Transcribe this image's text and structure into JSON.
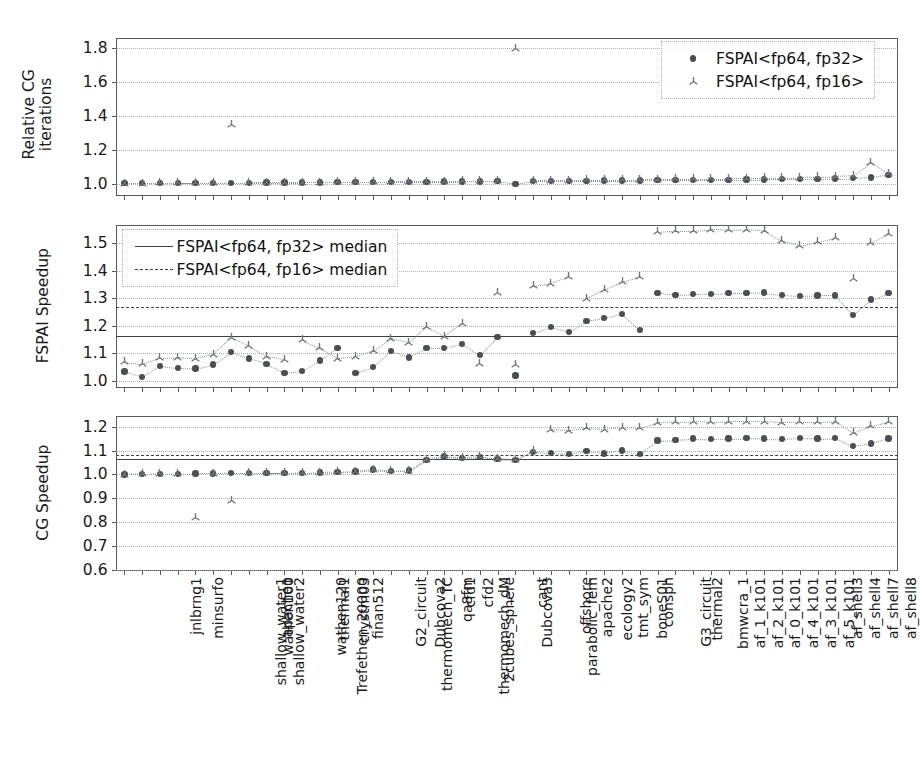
{
  "chart_data": {
    "type": "scatter",
    "title": "",
    "xlabel": "",
    "categories": [
      "jnlbrng1",
      "minsurfo",
      "shallow_water1",
      "shallow_water2",
      "wathen100",
      "apache1",
      "Trefethen_20000",
      "wathen120",
      "thermal1",
      "crystm03",
      "finan512",
      "thermomech_TC",
      "G2_circuit",
      "Dubcova2",
      "thermomech_dM",
      "2cubes_sphere",
      "qa8fm",
      "cfd1",
      "cfd2",
      "Dubcova3",
      "parabolic_fem",
      "cant",
      "offshore",
      "apache2",
      "ecology2",
      "tmt_sym",
      "boneS01",
      "consph",
      "G3_circuit",
      "thermal2",
      "bmwcra_1",
      "af_1_k101",
      "af_2_k101",
      "af_0_k101",
      "af_4_k101",
      "af_3_k101",
      "af_5_k101",
      "af_shell3",
      "af_shell4",
      "af_shell7",
      "af_shell8",
      "StocF-1465",
      "Emilia_923",
      "bone010"
    ],
    "legend_position": "upper right",
    "grid": true,
    "panels": [
      {
        "ylabel": "Relative CG\niterations",
        "ylim": [
          0.93,
          1.86
        ],
        "yticks": [
          1.0,
          1.2,
          1.4,
          1.6,
          1.8
        ],
        "ytick_labels": [
          "1.0",
          "1.2",
          "1.4",
          "1.6",
          "1.8"
        ],
        "legend": {
          "position": "upper-right",
          "entries": [
            {
              "label": "FSPAI<fp64, fp32>",
              "marker": "circle"
            },
            {
              "label": "FSPAI<fp64, fp16>",
              "marker": "tri-down"
            }
          ]
        },
        "series": [
          {
            "name": "FSPAI<fp64, fp32>",
            "marker": "circle",
            "values": [
              1.005,
              1.005,
              1.005,
              1.006,
              1.006,
              1.007,
              1.008,
              1.008,
              1.009,
              1.009,
              1.01,
              1.01,
              1.011,
              1.012,
              1.012,
              1.013,
              1.014,
              1.014,
              1.015,
              1.016,
              1.016,
              1.017,
              1.0,
              1.018,
              1.019,
              1.019,
              1.02,
              1.021,
              1.021,
              1.022,
              1.023,
              1.024,
              1.024,
              1.025,
              1.026,
              1.027,
              1.028,
              1.029,
              1.03,
              1.031,
              1.033,
              1.035,
              1.04,
              1.055
            ]
          },
          {
            "name": "FSPAI<fp64, fp16>",
            "marker": "tri-down",
            "values": [
              1.006,
              1.006,
              1.007,
              1.007,
              1.008,
              1.009,
              1.35,
              1.01,
              1.01,
              1.011,
              1.012,
              1.012,
              1.013,
              1.014,
              1.015,
              1.016,
              1.016,
              1.017,
              1.018,
              1.019,
              1.02,
              1.021,
              1.8,
              1.022,
              1.023,
              1.024,
              1.025,
              1.026,
              1.027,
              1.028,
              1.03,
              1.031,
              1.032,
              1.033,
              1.034,
              1.035,
              1.036,
              1.038,
              1.04,
              1.042,
              1.045,
              1.05,
              1.13,
              1.062
            ]
          }
        ]
      },
      {
        "ylabel": "FSPAI Speedup",
        "ylim": [
          0.975,
          1.565
        ],
        "yticks": [
          1.0,
          1.1,
          1.2,
          1.3,
          1.4,
          1.5
        ],
        "ytick_labels": [
          "1.0",
          "1.1",
          "1.2",
          "1.3",
          "1.4",
          "1.5"
        ],
        "legend": {
          "position": "upper-left",
          "entries": [
            {
              "label": "FSPAI<fp64, fp32> median",
              "marker": "line-solid"
            },
            {
              "label": "FSPAI<fp64, fp16> median",
              "marker": "line-dashed"
            }
          ]
        },
        "medians": [
          {
            "name": "FSPAI<fp64, fp32> median",
            "value": 1.165,
            "style": "solid"
          },
          {
            "name": "FSPAI<fp64, fp16> median",
            "value": 1.27,
            "style": "dashed"
          }
        ],
        "series": [
          {
            "name": "FSPAI<fp64, fp32>",
            "marker": "circle",
            "values": [
              1.035,
              1.015,
              1.055,
              1.047,
              1.045,
              1.06,
              1.105,
              1.082,
              1.063,
              1.03,
              1.037,
              1.075,
              1.12,
              1.03,
              1.05,
              1.108,
              1.086,
              1.12,
              1.12,
              1.135,
              1.095,
              1.16,
              1.02,
              1.175,
              1.195,
              1.178,
              1.218,
              1.228,
              1.243,
              1.185,
              1.318,
              1.312,
              1.315,
              1.316,
              1.318,
              1.318,
              1.32,
              1.312,
              1.308,
              1.31,
              1.31,
              1.24,
              1.295,
              1.318
            ]
          },
          {
            "name": "FSPAI<fp64, fp16>",
            "marker": "tri-down",
            "values": [
              1.07,
              1.062,
              1.085,
              1.087,
              1.082,
              1.097,
              1.158,
              1.128,
              1.09,
              1.078,
              1.15,
              1.12,
              1.083,
              1.09,
              1.11,
              1.155,
              1.14,
              1.196,
              1.162,
              1.21,
              1.065,
              1.32,
              1.06,
              1.345,
              1.355,
              1.38,
              1.3,
              1.33,
              1.36,
              1.38,
              1.54,
              1.545,
              1.545,
              1.55,
              1.548,
              1.55,
              1.545,
              1.51,
              1.49,
              1.505,
              1.52,
              1.37,
              1.5,
              1.535
            ]
          }
        ]
      },
      {
        "ylabel": "CG Speedup",
        "ylim": [
          0.595,
          1.245
        ],
        "yticks": [
          0.6,
          0.7,
          0.8,
          0.9,
          1.0,
          1.1,
          1.2
        ],
        "ytick_labels": [
          "0.6",
          "0.7",
          "0.8",
          "0.9",
          "1.0",
          "1.1",
          "1.2"
        ],
        "medians": [
          {
            "name": "FSPAI<fp64, fp32> median",
            "value": 1.065,
            "style": "solid"
          },
          {
            "name": "FSPAI<fp64, fp16> median",
            "value": 1.08,
            "style": "dashed"
          }
        ],
        "series": [
          {
            "name": "FSPAI<fp64, fp32>",
            "marker": "circle",
            "values": [
              1.0,
              1.002,
              1.003,
              1.003,
              1.004,
              1.004,
              1.005,
              1.005,
              1.006,
              1.006,
              1.007,
              1.008,
              1.01,
              1.012,
              1.02,
              1.014,
              1.016,
              1.06,
              1.075,
              1.07,
              1.072,
              1.065,
              1.06,
              1.095,
              1.09,
              1.085,
              1.098,
              1.088,
              1.1,
              1.085,
              1.142,
              1.145,
              1.15,
              1.148,
              1.15,
              1.152,
              1.15,
              1.148,
              1.152,
              1.15,
              1.152,
              1.118,
              1.13,
              1.15
            ]
          },
          {
            "name": "FSPAI<fp64, fp16>",
            "marker": "tri-down",
            "values": [
              1.0,
              1.002,
              1.003,
              1.003,
              0.82,
              1.005,
              0.89,
              1.006,
              1.006,
              1.007,
              1.008,
              1.009,
              1.011,
              1.013,
              1.022,
              1.016,
              1.018,
              1.063,
              1.078,
              1.072,
              1.075,
              1.068,
              1.062,
              1.1,
              1.19,
              1.185,
              1.195,
              1.19,
              1.198,
              1.195,
              1.218,
              1.22,
              1.222,
              1.22,
              1.222,
              1.222,
              1.222,
              1.218,
              1.22,
              1.22,
              1.222,
              1.175,
              1.205,
              1.222
            ]
          }
        ]
      }
    ]
  }
}
